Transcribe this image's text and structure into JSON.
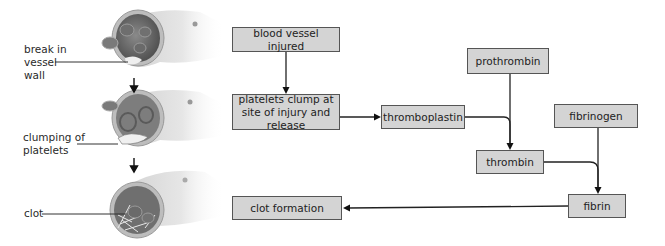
{
  "illustration": {
    "labels": [
      {
        "id": "break",
        "text": "break in\nvessel\nwall"
      },
      {
        "id": "clumping",
        "text": "clumping of\nplatelets"
      },
      {
        "id": "clot",
        "text": "clot"
      }
    ],
    "stages": [
      "injured vessel",
      "platelet clumping",
      "clot"
    ]
  },
  "flowchart": {
    "boxes": [
      {
        "id": "blood-vessel-injured",
        "text": "blood vessel injured"
      },
      {
        "id": "platelets-clump",
        "text": "platelets clump at site of injury and release"
      },
      {
        "id": "thromboplastin",
        "text": "thromboplastin"
      },
      {
        "id": "prothrombin",
        "text": "prothrombin"
      },
      {
        "id": "thrombin",
        "text": "thrombin"
      },
      {
        "id": "fibrinogen",
        "text": "fibrinogen"
      },
      {
        "id": "fibrin",
        "text": "fibrin"
      },
      {
        "id": "clot-formation",
        "text": "clot formation"
      }
    ],
    "edges": [
      {
        "from": "blood-vessel-injured",
        "to": "platelets-clump"
      },
      {
        "from": "platelets-clump",
        "to": "thromboplastin"
      },
      {
        "from": "thromboplastin",
        "to": "thrombin"
      },
      {
        "from": "prothrombin",
        "to": "thrombin"
      },
      {
        "from": "thrombin",
        "to": "fibrin"
      },
      {
        "from": "fibrinogen",
        "to": "fibrin"
      },
      {
        "from": "fibrin",
        "to": "clot-formation"
      }
    ],
    "colors": {
      "box_fill": "#d4d4d4",
      "box_border": "#555555",
      "line": "#222222"
    }
  }
}
